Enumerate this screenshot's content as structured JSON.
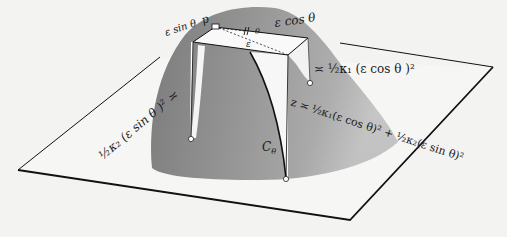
{
  "figure": {
    "type": "osculating-paraboloid-diagram",
    "background": "#f3f3f2",
    "surface_color": "#8c8c8c",
    "line_color": "#111111"
  },
  "labels": {
    "point_p": "p",
    "eps_sin": "ε sin θ",
    "eps_cos": "ε cos θ",
    "eps": "ε",
    "theta": "θ",
    "k1_term": "≍ ½κ₁ (ε cos θ )²",
    "k2_term": "½κ₂ (ε sin θ )² ≍",
    "curve_name": "C",
    "curve_sub": "θ",
    "z_formula": "z ≍ ½κ₁(ε cos θ)² + ½κ₂(ε sin θ)²"
  }
}
